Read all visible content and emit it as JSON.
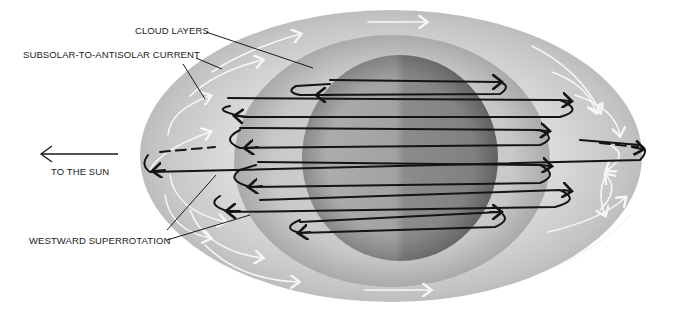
{
  "figure": {
    "type": "schematic",
    "colors": {
      "background": "#ffffff",
      "outer_shell": "#c8c8c8",
      "cloud_layer": "#b4b4b4",
      "planet_light": "#9a9a9a",
      "planet_dark": "#8a8a8a",
      "flow_lines": "#141414",
      "white_arrows": "#f6f6f6",
      "text": "#1a1a1a"
    }
  },
  "labels": {
    "cloud_layers": "CLOUD LAYERS",
    "subsolar_current": "SUBSOLAR-TO-ANTISOLAR CURRENT",
    "to_the_sun": "TO THE SUN",
    "westward_superrotation": "WESTWARD SUPERROTATION"
  },
  "icons": {
    "sun_direction_arrow": "left-arrow",
    "flow_arrowheads": "chevron-arrowheads",
    "white_current_arrows": "curved-arrows"
  }
}
